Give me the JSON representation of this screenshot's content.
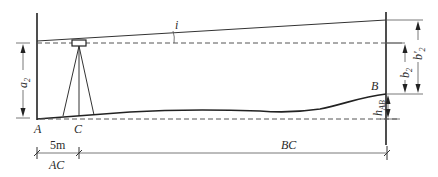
{
  "diagram": {
    "points": {
      "A": "A",
      "B": "B",
      "C": "C"
    },
    "angle_label": "i",
    "left_dimension": {
      "main": "a",
      "sub": "2"
    },
    "right_dimensions": {
      "b2": {
        "main": "b",
        "sub": "2"
      },
      "b2_prime": {
        "main": "b'",
        "sub": "2"
      },
      "hAB": {
        "main": "h",
        "sub": "AB"
      }
    },
    "bottom_dimensions": {
      "ac_distance": "5m",
      "ac_label": "AC",
      "bc_label": "BC"
    },
    "colors": {
      "line": "#333333",
      "dashed": "#555555",
      "background": "#ffffff"
    }
  }
}
